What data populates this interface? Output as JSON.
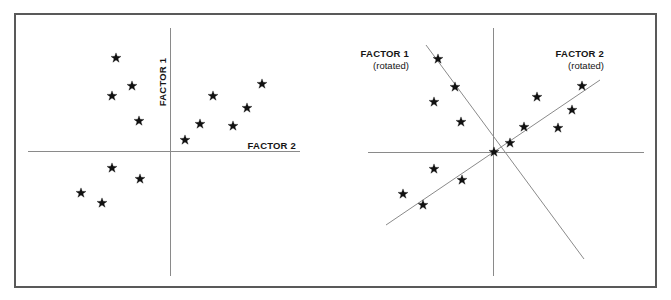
{
  "figure": {
    "width": 671,
    "height": 300,
    "background_color": "#ffffff",
    "frame_color": "#595959",
    "axis_color": "#8a8a8a",
    "marker_color": "#111111",
    "marker_glyph": "star",
    "frame": {
      "x": 14,
      "y": 13,
      "width": 643,
      "height": 275
    }
  },
  "panels": {
    "unrotated": {
      "name": "unrotated-factor-plot",
      "origin": {
        "x": 170,
        "y": 151
      },
      "vertical_axis": {
        "x": 170,
        "y1": 28,
        "y2": 276
      },
      "horizontal_axis": {
        "y": 151,
        "x1": 28,
        "x2": 300
      },
      "labels": {
        "vertical": {
          "text": "FACTOR 1",
          "x": 166,
          "y": 82,
          "rotation": -90
        },
        "horizontal": {
          "text": "FACTOR 2",
          "x": 296,
          "y": 149
        }
      }
    },
    "rotated": {
      "name": "rotated-factor-plot",
      "origin": {
        "x": 493,
        "y": 152
      },
      "vertical_axis": {
        "x": 493,
        "y1": 28,
        "y2": 276
      },
      "horizontal_axis": {
        "y": 152,
        "x1": 368,
        "x2": 644
      },
      "rotated_axis_factor1": {
        "x1": 426,
        "y1": 45,
        "x2": 584,
        "y2": 259
      },
      "rotated_axis_factor2": {
        "x1": 386,
        "y1": 225,
        "x2": 600,
        "y2": 80
      },
      "labels": {
        "factor1": {
          "line1": "FACTOR 1",
          "line2": "(rotated)",
          "x": 409,
          "y": 57
        },
        "factor2": {
          "line1": "FACTOR 2",
          "line2": "(rotated)",
          "x": 604,
          "y": 57
        }
      }
    }
  },
  "chart_data": {
    "type": "scatter",
    "xlabel": "FACTOR 2",
    "ylabel": "FACTOR 1",
    "grid": false,
    "legend": false,
    "panel_count": 2,
    "series": [
      {
        "name": "unrotated-cluster-a",
        "panel": "unrotated",
        "note": "upper-left and lower-left group",
        "points_px": [
          [
            116,
            58
          ],
          [
            132,
            86
          ],
          [
            112,
            96
          ],
          [
            139,
            121
          ],
          [
            112,
            168
          ],
          [
            140,
            179
          ],
          [
            81,
            193
          ],
          [
            102,
            203
          ]
        ]
      },
      {
        "name": "unrotated-cluster-b",
        "panel": "unrotated",
        "note": "right-side ascending group",
        "points_px": [
          [
            262,
            84
          ],
          [
            213,
            96
          ],
          [
            247,
            108
          ],
          [
            200,
            124
          ],
          [
            233,
            126
          ],
          [
            185,
            140
          ]
        ]
      },
      {
        "name": "rotated-cluster-a",
        "panel": "rotated",
        "note": "group aligned with rotated FACTOR 1 axis",
        "points_px": [
          [
            438,
            59
          ],
          [
            455,
            87
          ],
          [
            434,
            102
          ],
          [
            461,
            122
          ],
          [
            434,
            169
          ],
          [
            462,
            180
          ],
          [
            403,
            194
          ],
          [
            423,
            205
          ]
        ]
      },
      {
        "name": "rotated-cluster-b",
        "panel": "rotated",
        "note": "group aligned with rotated FACTOR 2 axis",
        "points_px": [
          [
            582,
            86
          ],
          [
            537,
            97
          ],
          [
            572,
            110
          ],
          [
            524,
            127
          ],
          [
            558,
            128
          ],
          [
            510,
            143
          ],
          [
            494,
            152
          ]
        ]
      }
    ],
    "axis_labels": [
      "FACTOR 1",
      "FACTOR 2",
      "FACTOR 1 (rotated)",
      "FACTOR 2 (rotated)"
    ]
  }
}
